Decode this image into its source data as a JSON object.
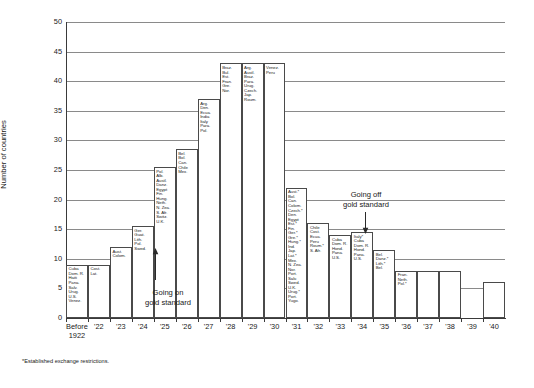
{
  "chart_data": {
    "type": "bar",
    "title": "",
    "xlabel": "",
    "ylabel": "Number of countries",
    "ylim": [
      0,
      50
    ],
    "ytick_step": 5,
    "grid": true,
    "legend": "none",
    "categories": [
      "Before 1922",
      "'22",
      "'23",
      "'24",
      "'25",
      "'26",
      "'27",
      "'28",
      "'29",
      "'30",
      "'31",
      "'32",
      "'33",
      "'34",
      "'35",
      "'36",
      "'37",
      "'38",
      "'39",
      "'40"
    ],
    "values": [
      9,
      9,
      12,
      15.5,
      25.5,
      28.5,
      37,
      43,
      43,
      43,
      22,
      16,
      14,
      14.5,
      11.5,
      8,
      8,
      8,
      0,
      6
    ],
    "bar_labels": [
      [
        "Cuba",
        "Dom. R.",
        "Haiti",
        "Pana.",
        "Salv.",
        "Urug.",
        "U.S.",
        "Venez."
      ],
      [
        "Cost.",
        "Lat."
      ],
      [
        "Aust.",
        "Colom."
      ],
      [
        "Ger.",
        "Guat.",
        "Lith.",
        "Pol.",
        "Swed."
      ],
      [
        "Pol.",
        "Alb.",
        "Austl.",
        "Danz.",
        "Egypt",
        "Fin.",
        "Hung.",
        "Neth.",
        "N. Zea.",
        "S. Afr.",
        "Switz.",
        "U.K."
      ],
      [
        "Bel.",
        "Bol.",
        "Can.",
        "Chile",
        "Mex."
      ],
      [
        "Arg.",
        "Den.",
        "Ecua.",
        "India",
        "Italy",
        "Para.",
        "Pol."
      ],
      [
        "Braz.",
        "Bul.",
        "Est.",
        "Fran.",
        "Gre.",
        "Nor."
      ],
      [
        "Arg.",
        "Austl.",
        "Braz.",
        "Para.",
        "Urug.",
        "Czech.",
        "Jap.",
        "Roum."
      ],
      [
        "Venez.",
        "Peru"
      ],
      [
        "Aust.*",
        "Bol.",
        "Can.",
        "Colom.",
        "Czech.*",
        "Den.",
        "Egypt",
        "Est.*",
        "Fin.",
        "Ger.*",
        "Gre.*",
        "Hung.*",
        "Ind.",
        "Jap.",
        "Lat.*",
        "Mex.",
        "N. Zea.",
        "Nor.",
        "Port.",
        "Salv.",
        "Swed.",
        "U.K.",
        "Urug.*",
        "Port.",
        "Yugo."
      ],
      [
        "Chile",
        "Cost.",
        "Ecua.",
        "Peru",
        "Roum.*",
        "S. Afr."
      ],
      [
        "Cuba",
        "Dom. R.",
        "Hond.",
        "Pana.",
        "U.S."
      ],
      [
        "Italy*",
        "Cuba",
        "Dom. R.",
        "Hond.",
        "Pana.",
        "U.S."
      ],
      [
        "Bel.",
        "Danz.*",
        "Lith.*",
        "Bel."
      ],
      [
        "Fran.",
        "Neth.",
        "Pol.*"
      ],
      [],
      [],
      [],
      []
    ],
    "annotations": [
      {
        "text": "Going on\ngold standard",
        "x_category": "'25",
        "direction": "up"
      },
      {
        "text": "Going off\ngold standard",
        "x_category": "'33",
        "direction": "down"
      }
    ],
    "footnote": "*Established exchange restrictions."
  },
  "axis": {
    "y_ticks": [
      "0",
      "5",
      "10",
      "15",
      "20",
      "25",
      "30",
      "35",
      "40",
      "45",
      "50"
    ],
    "y_title": "Number of countries",
    "x_ticks": [
      {
        "line1": "Before",
        "line2": "1922"
      },
      {
        "line1": "'22",
        "line2": ""
      },
      {
        "line1": "'23",
        "line2": ""
      },
      {
        "line1": "'24",
        "line2": ""
      },
      {
        "line1": "'25",
        "line2": ""
      },
      {
        "line1": "'26",
        "line2": ""
      },
      {
        "line1": "'27",
        "line2": ""
      },
      {
        "line1": "'28",
        "line2": ""
      },
      {
        "line1": "'29",
        "line2": ""
      },
      {
        "line1": "'30",
        "line2": ""
      },
      {
        "line1": "'31",
        "line2": ""
      },
      {
        "line1": "'32",
        "line2": ""
      },
      {
        "line1": "'33",
        "line2": ""
      },
      {
        "line1": "'34",
        "line2": ""
      },
      {
        "line1": "'35",
        "line2": ""
      },
      {
        "line1": "'36",
        "line2": ""
      },
      {
        "line1": "'37",
        "line2": ""
      },
      {
        "line1": "'38",
        "line2": ""
      },
      {
        "line1": "'39",
        "line2": ""
      },
      {
        "line1": "'40",
        "line2": ""
      }
    ]
  },
  "annotations": {
    "on_gold": "Going on\ngold standard",
    "on_gold_l1": "Going on",
    "on_gold_l2": "gold standard",
    "off_gold_l1": "Going off",
    "off_gold_l2": "gold standard"
  },
  "footnote": "*Established exchange restrictions.",
  "colors": {
    "grid": "#8a8a8a",
    "axis": "#3a3a3a",
    "bar_border": "#4a4a4a",
    "bar_fill": "#ffffff",
    "text": "#1a1a1a",
    "background": "#ffffff"
  }
}
